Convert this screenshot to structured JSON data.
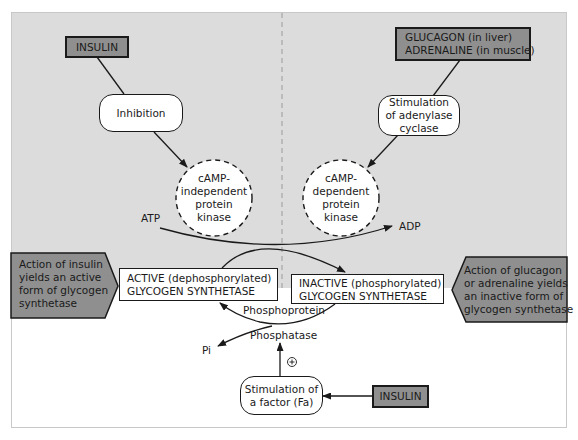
{
  "diagram": {
    "colors": {
      "background_upper": "#dcdcdc",
      "hormone_box_fill": "#8f8f8f",
      "callout_fill": "#8f8f8f",
      "stroke": "#1a1a1a",
      "divider": "#9a9a9a"
    },
    "left_top": {
      "hormone": "INSULIN",
      "step": "Inhibition",
      "enzyme": [
        "cAMP-",
        "independent",
        "protein",
        "kinase"
      ]
    },
    "right_top": {
      "hormone": [
        "GLUCAGON (in liver)",
        "ADRENALINE (in muscle)"
      ],
      "step": [
        "Stimulation",
        "of adenylase",
        "cyclase"
      ],
      "enzyme": [
        "cAMP-",
        "dependent",
        "protein",
        "kinase"
      ]
    },
    "reaction": {
      "substrate_in": "ATP",
      "product_out": "ADP",
      "phosphatase_label_1": "Phosphoprotein",
      "phosphatase_label_2": "Phosphatase",
      "released": "Pi",
      "plus_sign": "+"
    },
    "active_box": [
      "ACTIVE (dephosphorylated)",
      "GLYCOGEN SYNTHETASE"
    ],
    "inactive_box": [
      "INACTIVE (phosphorylated)",
      "GLYCOGEN SYNTHETASE"
    ],
    "left_callout": [
      "Action of insulin",
      "yields an active",
      "form of glycogen",
      "synthetase"
    ],
    "right_callout": [
      "Action of glucagon",
      "or adrenaline yields",
      "an inactive form of",
      "glycogen synthetase"
    ],
    "bottom": {
      "factor": [
        "Stimulation of",
        "a factor (Fa)"
      ],
      "hormone": "INSULIN"
    }
  }
}
